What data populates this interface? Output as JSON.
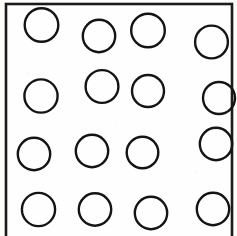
{
  "figure": {
    "kind": "line-drawing",
    "canvas": {
      "width": 237,
      "height": 236
    },
    "background_color": "#fdfdfb",
    "ink_color": "#141414"
  },
  "plate": {
    "label": "plate-outline",
    "shape": "rectangle",
    "x": 6,
    "y": 4,
    "width": 226,
    "height": 240,
    "stroke_color": "#1b1b1b",
    "stroke_width": 2.6,
    "fill_color": "#fefefe",
    "bottom_edge_visible": false
  },
  "holes": {
    "label": "hole-pattern",
    "count": 16,
    "rows": 4,
    "columns": 4,
    "arrangement": "staggered-grid",
    "stroke_color": "#141414",
    "stroke_width": 2.4,
    "items": [
      {
        "id": "hole-r1-c1",
        "row": 1,
        "column": 1,
        "cx": 41.5,
        "cy": 25.0,
        "r": 16.8
      },
      {
        "id": "hole-r1-c2",
        "row": 1,
        "column": 2,
        "cx": 99.0,
        "cy": 36.0,
        "r": 16.2
      },
      {
        "id": "hole-r1-c3",
        "row": 1,
        "column": 3,
        "cx": 148.0,
        "cy": 30.5,
        "r": 16.8
      },
      {
        "id": "hole-r1-c4",
        "row": 1,
        "column": 4,
        "cx": 211.5,
        "cy": 42.0,
        "r": 16.4
      },
      {
        "id": "hole-r2-c1",
        "row": 2,
        "column": 1,
        "cx": 41.0,
        "cy": 96.0,
        "r": 16.6
      },
      {
        "id": "hole-r2-c2",
        "row": 2,
        "column": 2,
        "cx": 102.0,
        "cy": 86.5,
        "r": 16.4
      },
      {
        "id": "hole-r2-c3",
        "row": 2,
        "column": 3,
        "cx": 148.0,
        "cy": 91.0,
        "r": 16.0
      },
      {
        "id": "hole-r2-c4",
        "row": 2,
        "column": 4,
        "cx": 219.0,
        "cy": 98.0,
        "r": 16.0
      },
      {
        "id": "hole-r3-c1",
        "row": 3,
        "column": 1,
        "cx": 34.0,
        "cy": 154.0,
        "r": 16.2
      },
      {
        "id": "hole-r3-c2",
        "row": 3,
        "column": 2,
        "cx": 92.0,
        "cy": 151.0,
        "r": 16.2
      },
      {
        "id": "hole-r3-c3",
        "row": 3,
        "column": 3,
        "cx": 142.5,
        "cy": 152.5,
        "r": 15.8
      },
      {
        "id": "hole-r3-c4",
        "row": 3,
        "column": 4,
        "cx": 216.0,
        "cy": 144.0,
        "r": 16.2
      },
      {
        "id": "hole-r4-c1",
        "row": 4,
        "column": 1,
        "cx": 38.5,
        "cy": 209.5,
        "r": 16.6
      },
      {
        "id": "hole-r4-c2",
        "row": 4,
        "column": 2,
        "cx": 95.0,
        "cy": 209.5,
        "r": 16.2
      },
      {
        "id": "hole-r4-c3",
        "row": 4,
        "column": 3,
        "cx": 151.0,
        "cy": 213.0,
        "r": 16.2
      },
      {
        "id": "hole-r4-c4",
        "row": 4,
        "column": 4,
        "cx": 213.0,
        "cy": 209.0,
        "r": 16.2
      }
    ]
  }
}
